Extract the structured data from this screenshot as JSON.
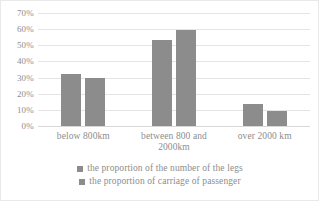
{
  "chart_data": {
    "type": "bar",
    "title": "",
    "xlabel": "",
    "ylabel": "",
    "ylim": [
      0,
      70
    ],
    "grid": true,
    "legend_position": "bottom",
    "categories": [
      "below 800km",
      "between 800 and 2000km",
      "over 2000 km"
    ],
    "ytick_labels": [
      "70%",
      "60%",
      "50%",
      "40%",
      "30%",
      "20%",
      "10%",
      "0%"
    ],
    "ytick_values": [
      70,
      60,
      50,
      40,
      30,
      20,
      10,
      0
    ],
    "series": [
      {
        "name": "the proportion of the number of the legs",
        "color": "#8c8c8c",
        "values": [
          32,
          53,
          13.5
        ]
      },
      {
        "name": "the proportion of carriage of passenger",
        "color": "#8c8c8c",
        "values": [
          30,
          59.5,
          9.5
        ]
      }
    ]
  },
  "colors": {
    "series_gray": "#8c8c8c",
    "gridline": "#e4e4e4",
    "baseline": "#d8d8d8",
    "text": "#8d8d8d",
    "frame": "#e9e9e9"
  },
  "title_clipped": "clipped-title-descenders"
}
